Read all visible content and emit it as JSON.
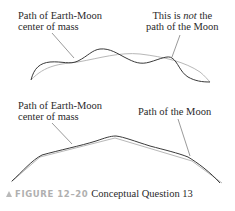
{
  "top_panel": {
    "label_left_line1": "Path of Earth-Moon",
    "label_left_line2": "center of mass",
    "label_right_line1_pre": "This is ",
    "label_right_line1_em": "not",
    "label_right_line1_post": " the",
    "label_right_line2": "path of the Moon"
  },
  "bottom_panel": {
    "label_left_line1": "Path of Earth-Moon",
    "label_left_line2": "center of mass",
    "label_right": "Path of the Moon"
  },
  "caption": {
    "figure_label": "FIGURE 12–20",
    "text": "Conceptual Question 13"
  },
  "colors": {
    "moon_path": "#3a3a3a",
    "center_of_mass_path": "#b8b8b8",
    "leader_line": "#555555",
    "caption_marker": "#b9b9b9"
  }
}
